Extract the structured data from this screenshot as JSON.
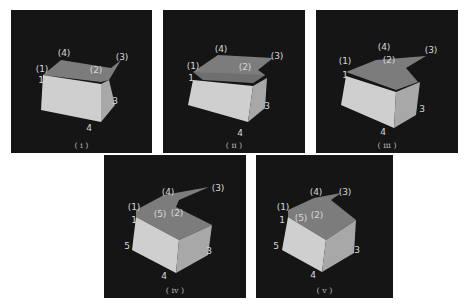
{
  "figure": {
    "panels": [
      {
        "caption": "( i )",
        "labels": {
          "p1": "(1)",
          "p2": "(2)",
          "p3": "(3)",
          "p4": "(4)",
          "n1": "1",
          "n3": "3",
          "n4": "4"
        }
      },
      {
        "caption": "( ii )",
        "labels": {
          "p1": "(1)",
          "p2": "(2)",
          "p3": "(3)",
          "p4": "(4)",
          "n1": "1",
          "n3": "3",
          "n4": "4"
        }
      },
      {
        "caption": "( iii )",
        "labels": {
          "p1": "(1)",
          "p2": "(2)",
          "p3": "(3)",
          "p4": "(4)",
          "n1": "1",
          "n3": "3",
          "n4": "4"
        }
      },
      {
        "caption": "( iv )",
        "labels": {
          "p1": "(1)",
          "p2": "(2)",
          "p3": "(3)",
          "p4": "(4)",
          "p5": "(5)",
          "n1": "1",
          "n3": "3",
          "n4": "4",
          "n5": "5"
        }
      },
      {
        "caption": "( v )",
        "labels": {
          "p1": "(1)",
          "p2": "(2)",
          "p3": "(3)",
          "p4": "(4)",
          "p5": "(5)",
          "n1": "1",
          "n3": "3",
          "n4": "4",
          "n5": "5"
        }
      }
    ],
    "colors": {
      "background": "#151515",
      "face_front": "#c8c8c8",
      "face_side": "#a9a9a9",
      "face_top": "#7a7a7a",
      "label": "#d8d8d8"
    }
  }
}
